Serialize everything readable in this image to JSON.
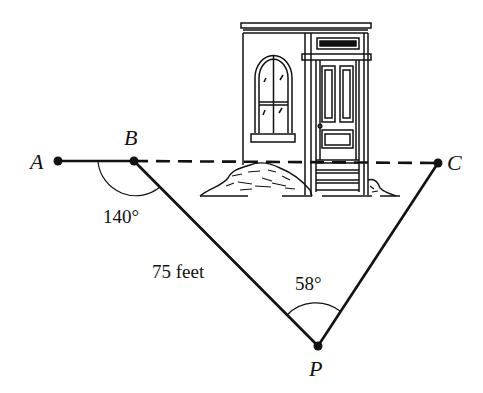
{
  "diagram": {
    "points": {
      "A": {
        "label": "A",
        "x": 58,
        "y": 161
      },
      "B": {
        "label": "B",
        "x": 134,
        "y": 161
      },
      "C": {
        "label": "C",
        "x": 438,
        "y": 163
      },
      "P": {
        "label": "P",
        "x": 318,
        "y": 346
      }
    },
    "segments": [
      {
        "from": "A",
        "to": "B",
        "style": "solid"
      },
      {
        "from": "B",
        "to": "C",
        "style": "dashed"
      },
      {
        "from": "B",
        "to": "P",
        "style": "solid"
      },
      {
        "from": "P",
        "to": "C",
        "style": "solid"
      }
    ],
    "annotations": {
      "angle_B": "140°",
      "angle_P": "58°",
      "side_BP": "75 feet"
    },
    "illustration": "house-facade-with-arched-window-and-door"
  }
}
